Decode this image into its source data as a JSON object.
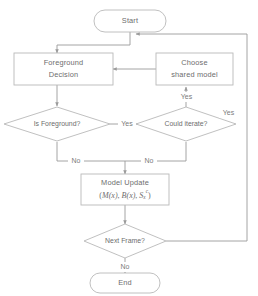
{
  "diagram": {
    "type": "flowchart",
    "colors": {
      "background": "#ffffff",
      "stroke": "#b9b9b9",
      "edge": "#9a9a9a",
      "text": "#6d6d6d"
    },
    "nodes": {
      "start": {
        "label": "Start",
        "shape": "terminator"
      },
      "foreground_decision": {
        "label_line1": "Foreground",
        "label_line2": "Decision",
        "shape": "process"
      },
      "choose_shared_model": {
        "label_line1": "Choose",
        "label_line2": "shared model",
        "shape": "process"
      },
      "is_foreground": {
        "label": "Is Foreground?",
        "shape": "decision"
      },
      "could_iterate": {
        "label": "Could iterate?",
        "shape": "decision"
      },
      "model_update": {
        "label_line1": "Model Update",
        "formula_open": "(",
        "formula_m": "M",
        "formula_m_arg": "(x)",
        "formula_sep1": ", ",
        "formula_b": "B",
        "formula_b_arg": "(x)",
        "formula_sep2": ", ",
        "formula_s": "S",
        "formula_s_sub": "x",
        "formula_s_sup": "c",
        "formula_close": ")",
        "shape": "process"
      },
      "next_frame": {
        "label": "Next Frame?",
        "shape": "decision"
      },
      "end": {
        "label": "End",
        "shape": "terminator"
      }
    },
    "edge_labels": {
      "is_foreground_yes": "Yes",
      "is_foreground_no": "No",
      "could_iterate_yes": "Yes",
      "could_iterate_no": "No",
      "next_frame_yes": "Yes",
      "next_frame_no": "No"
    }
  }
}
